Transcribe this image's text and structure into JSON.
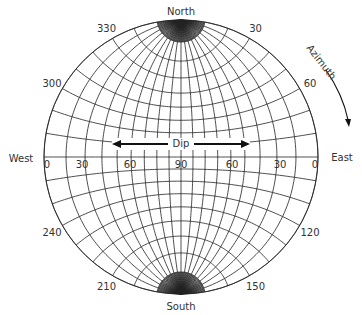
{
  "diagram": {
    "type": "equal-angle stereonet (Wulff net)",
    "directions": {
      "north": "North",
      "south": "South",
      "east": "East",
      "west": "West"
    },
    "azimuth_labels": [
      {
        "value": "30",
        "angle": 30
      },
      {
        "value": "60",
        "angle": 60
      },
      {
        "value": "120",
        "angle": 120
      },
      {
        "value": "150",
        "angle": 150
      },
      {
        "value": "210",
        "angle": 210
      },
      {
        "value": "240",
        "angle": 240
      },
      {
        "value": "300",
        "angle": 300
      },
      {
        "value": "330",
        "angle": 330
      }
    ],
    "dip_labels": [
      "0",
      "30",
      "60",
      "90",
      "60",
      "30",
      "0"
    ],
    "dip_title": "Dip",
    "azimuth_title": "Azimuth",
    "grid_interval_degrees": 10,
    "line_color": "#222222"
  }
}
